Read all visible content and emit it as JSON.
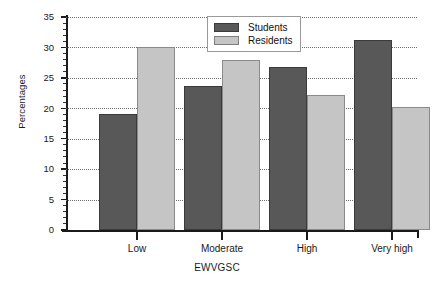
{
  "chart_data": {
    "type": "bar",
    "title": "",
    "subtitle": "",
    "xlabel": "EWVGSC",
    "ylabel": "Percentages",
    "categories": [
      "Low",
      "Moderate",
      "High",
      "Very high"
    ],
    "series": [
      {
        "name": "Students",
        "values": [
          19.0,
          23.6,
          26.8,
          31.2
        ],
        "color": "#585858"
      },
      {
        "name": "Residents",
        "values": [
          30.0,
          28.0,
          22.2,
          20.2
        ],
        "color": "#c5c5c5"
      }
    ],
    "ylim": [
      0,
      35
    ],
    "ytick_values": [
      0,
      5,
      10,
      15,
      20,
      25,
      30,
      35
    ],
    "ytick_labels": [
      "0",
      "5",
      "10",
      "15",
      "20",
      "25",
      "30",
      "35"
    ],
    "ytick_minor_step": 1,
    "grid": true,
    "grid_axis": "y",
    "grid_style": "dotted",
    "legend_position": "top-center",
    "legend_entries": [
      "Students",
      "Residents"
    ]
  },
  "colors": {
    "students": "#585858",
    "residents": "#c5c5c5",
    "axis": "#1a1a1a",
    "grid": "#6e6e6e",
    "background": "#ffffff"
  }
}
